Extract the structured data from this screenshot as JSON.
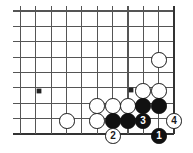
{
  "figure": {
    "board_type": "go-board-corner",
    "background_color": "#ffffff",
    "line_color": "#555555",
    "edge_line_color": "#333333",
    "black_color": "#111111",
    "white_color": "#ffffff"
  },
  "board": {
    "origin_x": 20.5,
    "origin_y": 11,
    "spacing": 15.35,
    "columns": 11,
    "rows": 9,
    "edge_right_index": 10,
    "edge_bottom_index": 8,
    "stone_diameter": 15.5
  },
  "star_points": [
    {
      "name": "star-point-left",
      "col": 1.2,
      "row": 5.2,
      "x": 39,
      "y": 91
    },
    {
      "name": "star-point-right",
      "col": 7.2,
      "row": 5.2,
      "x": 131,
      "y": 90
    }
  ],
  "stones": [
    {
      "id": "white-upper-right",
      "color": "white",
      "label": "",
      "x": 159,
      "y": 60
    },
    {
      "id": "white-left-lone",
      "color": "white",
      "label": "",
      "x": 67,
      "y": 121
    },
    {
      "id": "white-r6-c8",
      "color": "white",
      "label": "",
      "x": 143,
      "y": 91
    },
    {
      "id": "white-r6-c9",
      "color": "white",
      "label": "",
      "x": 159,
      "y": 91
    },
    {
      "id": "white-r7-c5",
      "color": "white",
      "label": "",
      "x": 97,
      "y": 106
    },
    {
      "id": "white-r7-c6",
      "color": "white",
      "label": "",
      "x": 113,
      "y": 106
    },
    {
      "id": "white-r7-c7",
      "color": "white",
      "label": "",
      "x": 128,
      "y": 106
    },
    {
      "id": "black-r7-c8",
      "color": "black",
      "label": "",
      "x": 143,
      "y": 106
    },
    {
      "id": "black-r7-c9",
      "color": "black",
      "label": "",
      "x": 159,
      "y": 106
    },
    {
      "id": "white-r8-c5",
      "color": "white",
      "label": "",
      "x": 97,
      "y": 121
    },
    {
      "id": "black-r8-c6",
      "color": "black",
      "label": "",
      "x": 113,
      "y": 121
    },
    {
      "id": "black-r8-c7",
      "color": "black",
      "label": "",
      "x": 128,
      "y": 121
    },
    {
      "id": "black-move-3",
      "color": "black",
      "label": "3",
      "x": 143,
      "y": 121
    },
    {
      "id": "white-move-4",
      "color": "white",
      "label": "4",
      "x": 174,
      "y": 121
    },
    {
      "id": "white-move-2",
      "color": "white",
      "label": "2",
      "x": 113,
      "y": 136
    },
    {
      "id": "black-move-1",
      "color": "black",
      "label": "1",
      "x": 159,
      "y": 136
    }
  ],
  "move_sequence": [
    {
      "number": "1",
      "color": "black"
    },
    {
      "number": "2",
      "color": "white"
    },
    {
      "number": "3",
      "color": "black"
    },
    {
      "number": "4",
      "color": "white"
    }
  ]
}
